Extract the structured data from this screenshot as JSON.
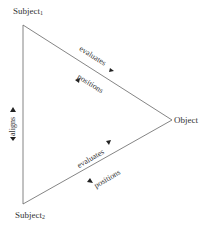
{
  "nodes": {
    "subject1": {
      "label": "Subject",
      "sub": "1"
    },
    "subject2": {
      "label": "Subject",
      "sub": "2"
    },
    "object": {
      "label": "Object"
    }
  },
  "edges": {
    "top_evaluates": "evaluates",
    "top_positions": "positions",
    "left_aligns": "aligns",
    "bottom_evaluates": "evaluates",
    "bottom_positions": "positions"
  },
  "arrow_icon": "▲",
  "colors": {
    "line": "#555555",
    "text": "#333333"
  }
}
